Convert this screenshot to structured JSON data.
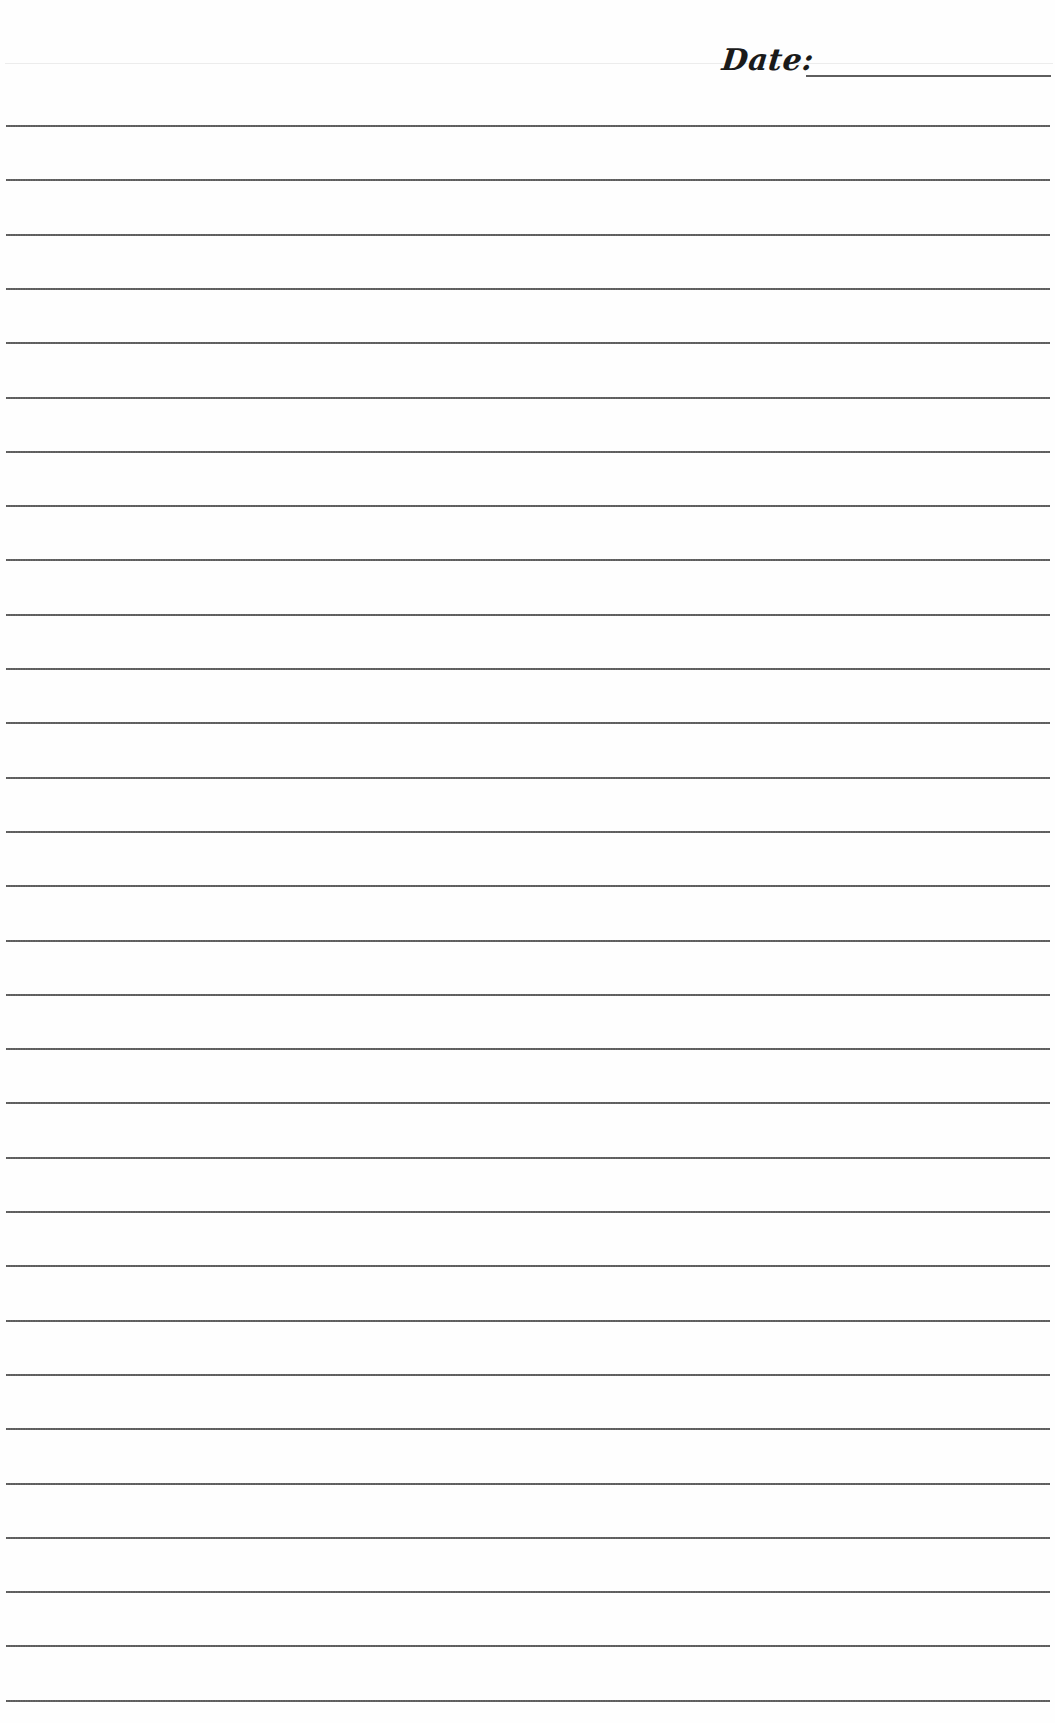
{
  "header": {
    "date_label": "Date:",
    "date_value": ""
  },
  "paper": {
    "background": "#fefefe",
    "line_color": "#5e5e5e",
    "line_count": 30,
    "first_line_y": 125,
    "line_spacing": 54.3
  },
  "lines": [
    {
      "value": ""
    },
    {
      "value": ""
    },
    {
      "value": ""
    },
    {
      "value": ""
    },
    {
      "value": ""
    },
    {
      "value": ""
    },
    {
      "value": ""
    },
    {
      "value": ""
    },
    {
      "value": ""
    },
    {
      "value": ""
    },
    {
      "value": ""
    },
    {
      "value": ""
    },
    {
      "value": ""
    },
    {
      "value": ""
    },
    {
      "value": ""
    },
    {
      "value": ""
    },
    {
      "value": ""
    },
    {
      "value": ""
    },
    {
      "value": ""
    },
    {
      "value": ""
    },
    {
      "value": ""
    },
    {
      "value": ""
    },
    {
      "value": ""
    },
    {
      "value": ""
    },
    {
      "value": ""
    },
    {
      "value": ""
    },
    {
      "value": ""
    },
    {
      "value": ""
    },
    {
      "value": ""
    },
    {
      "value": ""
    }
  ]
}
